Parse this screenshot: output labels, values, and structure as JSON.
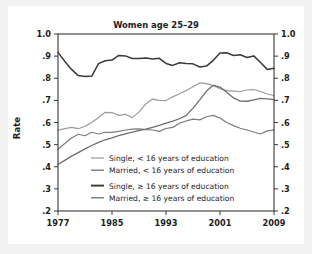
{
  "chart_data": {
    "type": "line",
    "title": "Women age 25–29",
    "xlabel": "",
    "ylabel": "Rate",
    "xlim": [
      1977,
      2009
    ],
    "ylim": [
      0.2,
      1.0
    ],
    "grid": false,
    "legend_position": "inside-lower-left",
    "x_ticks": [
      "1977",
      "1985",
      "1993",
      "2001",
      "2009"
    ],
    "x_tick_values": [
      1977,
      1985,
      1993,
      2001,
      2009
    ],
    "y_ticks": [
      "1.0",
      ".9",
      ".8",
      ".7",
      ".6",
      ".5",
      ".4",
      ".3",
      ".2"
    ],
    "y_tick_values": [
      1.0,
      0.9,
      0.8,
      0.7,
      0.6,
      0.5,
      0.4,
      0.3,
      0.2
    ],
    "y_axis_mirrored": true,
    "x": [
      1977,
      1978,
      1979,
      1980,
      1981,
      1982,
      1983,
      1984,
      1985,
      1986,
      1987,
      1988,
      1989,
      1990,
      1991,
      1992,
      1993,
      1994,
      1995,
      1996,
      1997,
      1998,
      1999,
      2000,
      2001,
      2002,
      2003,
      2004,
      2005,
      2006,
      2007,
      2008,
      2009
    ],
    "series": [
      {
        "name": "Single, < 16 years of education",
        "color": "#9a9a9a",
        "width": 1.2,
        "values": [
          0.565,
          0.572,
          0.578,
          0.572,
          0.583,
          0.6,
          0.623,
          0.646,
          0.645,
          0.632,
          0.637,
          0.622,
          0.647,
          0.684,
          0.706,
          0.7,
          0.699,
          0.716,
          0.73,
          0.745,
          0.762,
          0.779,
          0.776,
          0.767,
          0.753,
          0.744,
          0.742,
          0.74,
          0.747,
          0.749,
          0.74,
          0.729,
          0.722
        ]
      },
      {
        "name": "Married, < 16 years of education",
        "color": "#7d7d7d",
        "width": 1.2,
        "values": [
          0.479,
          0.505,
          0.53,
          0.547,
          0.54,
          0.556,
          0.548,
          0.556,
          0.555,
          0.56,
          0.566,
          0.57,
          0.571,
          0.568,
          0.566,
          0.56,
          0.573,
          0.578,
          0.597,
          0.607,
          0.615,
          0.612,
          0.626,
          0.632,
          0.62,
          0.6,
          0.586,
          0.574,
          0.566,
          0.557,
          0.548,
          0.562,
          0.567
        ]
      },
      {
        "name": "Single, ≥ 16 years of education",
        "color": "#3a3a3a",
        "width": 1.5,
        "values": [
          0.917,
          0.877,
          0.84,
          0.812,
          0.808,
          0.81,
          0.866,
          0.879,
          0.882,
          0.903,
          0.901,
          0.889,
          0.889,
          0.892,
          0.887,
          0.89,
          0.867,
          0.858,
          0.87,
          0.867,
          0.865,
          0.851,
          0.855,
          0.881,
          0.914,
          0.915,
          0.903,
          0.906,
          0.894,
          0.901,
          0.871,
          0.84,
          0.845
        ]
      },
      {
        "name": "Married, ≥ 16 years of education",
        "color": "#6e6e6e",
        "width": 1.3,
        "values": [
          0.41,
          0.429,
          0.448,
          0.464,
          0.481,
          0.496,
          0.51,
          0.522,
          0.531,
          0.541,
          0.549,
          0.556,
          0.563,
          0.57,
          0.578,
          0.587,
          0.597,
          0.606,
          0.617,
          0.632,
          0.665,
          0.702,
          0.742,
          0.768,
          0.76,
          0.737,
          0.711,
          0.697,
          0.696,
          0.702,
          0.709,
          0.707,
          0.703
        ]
      }
    ],
    "legend_entries": [
      {
        "label": "Single, < 16 years of education",
        "color": "#9a9a9a",
        "width": 1.2
      },
      {
        "label": "Married, < 16 years of education",
        "color": "#7d7d7d",
        "width": 1.4
      },
      {
        "label": "Single, ≥ 16 years of education",
        "color": "#3a3a3a",
        "width": 1.9
      },
      {
        "label": "Married, ≥ 16 years of education",
        "color": "#6e6e6e",
        "width": 1.3
      }
    ]
  },
  "colors": {
    "frame": "#3a3a3a",
    "text": "#1d1d1d",
    "card_background": "#ffffff",
    "outer_background": "#f2f2f2"
  }
}
